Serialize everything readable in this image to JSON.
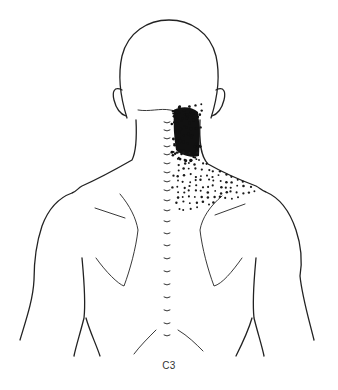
{
  "figure": {
    "caption": "C3",
    "shading": {
      "region": "right-neck-and-upper-trapezium",
      "dense_color": "#111111",
      "dot_color": "#1a1a1a"
    },
    "line_color": "#222222",
    "background": "#ffffff"
  }
}
